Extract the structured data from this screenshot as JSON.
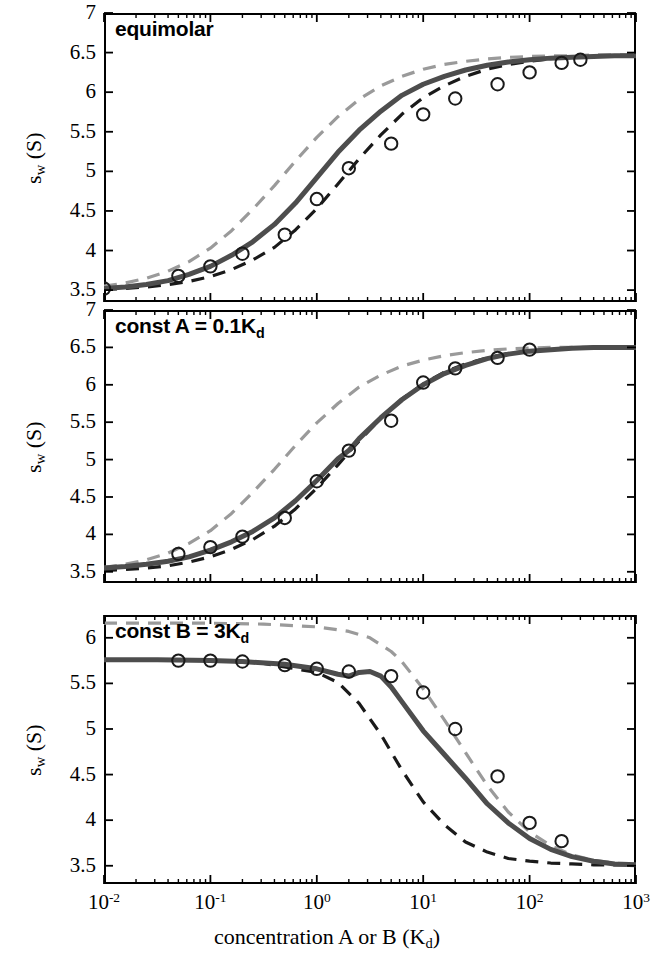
{
  "figure": {
    "xaxis": {
      "label_prefix": "concentration A or B (K",
      "label_sub": "d",
      "label_suffix": ")",
      "scale": "log",
      "min": 0.01,
      "max": 1000,
      "tick_labels": [
        "10⁻²",
        "10⁻¹",
        "10⁰",
        "10¹",
        "10²",
        "10³"
      ],
      "tick_mantissas": [
        "10",
        "10",
        "10",
        "10",
        "10",
        "10"
      ],
      "tick_exponents": [
        "-2",
        "-1",
        "0",
        "1",
        "2",
        "3"
      ],
      "tick_values": [
        0.01,
        0.1,
        1,
        10,
        100,
        1000
      ]
    },
    "yaxis": {
      "label_main": "s",
      "label_sub": "w",
      "label_unit": " (S)"
    },
    "colors": {
      "solid_curve": "#4d4d4d",
      "upper_dashed": "#9a9a9a",
      "lower_dashed": "#1a1a1a",
      "marker_edge": "#1a1a1a",
      "axis": "#000000",
      "background": "#ffffff"
    }
  },
  "chart_data": [
    {
      "type": "line",
      "panel_index": 0,
      "title_prefix": "equimolar",
      "title_sub": "",
      "title_suffix": "",
      "xlabel": "concentration A or B (Kd)",
      "ylabel": "sw (S)",
      "xscale": "log",
      "xlim": [
        0.01,
        1000
      ],
      "ylim": [
        3.35,
        7.0
      ],
      "ytick_values": [
        3.5,
        4,
        4.5,
        5,
        5.5,
        6,
        6.5,
        7
      ],
      "ytick_labels": [
        "3.5",
        "4",
        "4.5",
        "5",
        "5.5",
        "6",
        "6.5",
        "7"
      ],
      "grid": false,
      "legend": "none",
      "series": [
        {
          "name": "sw isotherm (solid, thick gray)",
          "style": "solid",
          "color": "#4d4d4d",
          "x": [
            0.01,
            0.0158,
            0.025,
            0.04,
            0.063,
            0.1,
            0.158,
            0.25,
            0.4,
            0.63,
            1.0,
            1.58,
            2.5,
            4.0,
            6.3,
            10.0,
            15.8,
            25.0,
            40.0,
            63.0,
            100.0,
            158.0,
            250.0,
            400.0,
            630.0,
            1000.0
          ],
          "y": [
            3.52,
            3.54,
            3.57,
            3.62,
            3.7,
            3.8,
            3.94,
            4.11,
            4.33,
            4.6,
            4.92,
            5.24,
            5.52,
            5.76,
            5.96,
            6.1,
            6.2,
            6.28,
            6.34,
            6.38,
            6.41,
            6.43,
            6.44,
            6.45,
            6.46,
            6.46
          ]
        },
        {
          "name": "upper bound (light gray dashed)",
          "style": "dashed",
          "color": "#9a9a9a",
          "x": [
            0.01,
            0.0158,
            0.025,
            0.04,
            0.063,
            0.1,
            0.158,
            0.25,
            0.4,
            0.63,
            1.0,
            1.58,
            2.5,
            4.0,
            6.3,
            10.0,
            15.8,
            25.0,
            40.0,
            63.0,
            100.0,
            158.0,
            250.0,
            400.0,
            630.0,
            1000.0
          ],
          "y": [
            3.55,
            3.59,
            3.65,
            3.74,
            3.86,
            4.03,
            4.25,
            4.52,
            4.82,
            5.13,
            5.43,
            5.69,
            5.91,
            6.08,
            6.2,
            6.29,
            6.35,
            6.39,
            6.42,
            6.44,
            6.45,
            6.46,
            6.46,
            6.47,
            6.47,
            6.47
          ]
        },
        {
          "name": "lower bound (black dashed)",
          "style": "dashed",
          "color": "#1a1a1a",
          "x": [
            0.01,
            0.0158,
            0.025,
            0.04,
            0.063,
            0.1,
            0.158,
            0.25,
            0.4,
            0.63,
            1.0,
            1.58,
            2.5,
            4.0,
            6.3,
            10.0,
            15.8,
            25.0,
            40.0,
            63.0,
            100.0,
            158.0,
            250.0,
            400.0,
            630.0,
            1000.0
          ],
          "y": [
            3.51,
            3.52,
            3.54,
            3.57,
            3.61,
            3.67,
            3.76,
            3.88,
            4.04,
            4.26,
            4.53,
            4.84,
            5.16,
            5.46,
            5.72,
            5.93,
            6.08,
            6.2,
            6.29,
            6.35,
            6.39,
            6.42,
            6.44,
            6.45,
            6.46,
            6.46
          ]
        }
      ],
      "markers": {
        "name": "simulated data points (open circles)",
        "x": [
          0.01,
          0.05,
          0.1,
          0.2,
          0.5,
          1.0,
          2.0,
          5.0,
          10.0,
          20.0,
          50.0,
          100.0,
          200.0,
          300.0
        ],
        "y": [
          3.52,
          3.68,
          3.8,
          3.96,
          4.2,
          4.65,
          5.04,
          5.35,
          5.72,
          5.92,
          6.1,
          6.25,
          6.37,
          6.41
        ]
      }
    },
    {
      "type": "line",
      "panel_index": 1,
      "title_prefix": "const A = 0.1K",
      "title_sub": "d",
      "title_suffix": "",
      "xlabel": "concentration A or B (Kd)",
      "ylabel": "sw (S)",
      "xscale": "log",
      "xlim": [
        0.01,
        1000
      ],
      "ylim": [
        3.35,
        7.0
      ],
      "ytick_values": [
        3.5,
        4,
        4.5,
        5,
        5.5,
        6,
        6.5,
        7
      ],
      "ytick_labels": [
        "3.5",
        "4",
        "4.5",
        "5",
        "5.5",
        "6",
        "6.5",
        "7"
      ],
      "grid": false,
      "legend": "none",
      "series": [
        {
          "name": "sw isotherm (solid, thick gray)",
          "style": "solid",
          "color": "#4d4d4d",
          "x": [
            0.01,
            0.0158,
            0.025,
            0.04,
            0.063,
            0.1,
            0.158,
            0.25,
            0.4,
            0.63,
            1.0,
            1.58,
            2.0,
            2.5,
            4.0,
            6.3,
            10.0,
            15.8,
            25.0,
            40.0,
            63.0,
            100.0,
            158.0,
            250.0,
            400.0,
            630.0,
            1000.0
          ],
          "y": [
            3.55,
            3.57,
            3.6,
            3.64,
            3.7,
            3.79,
            3.9,
            4.04,
            4.22,
            4.45,
            4.72,
            5.01,
            5.12,
            5.28,
            5.56,
            5.8,
            6.0,
            6.15,
            6.26,
            6.35,
            6.41,
            6.45,
            6.47,
            6.49,
            6.5,
            6.5,
            6.5
          ]
        },
        {
          "name": "upper bound (light gray dashed)",
          "style": "dashed",
          "color": "#9a9a9a",
          "x": [
            0.01,
            0.0158,
            0.025,
            0.04,
            0.063,
            0.1,
            0.158,
            0.25,
            0.4,
            0.63,
            1.0,
            1.58,
            2.5,
            4.0,
            6.3,
            10.0,
            15.8,
            25.0,
            40.0,
            63.0,
            100.0,
            158.0,
            250.0,
            400.0,
            630.0,
            1000.0
          ],
          "y": [
            3.56,
            3.6,
            3.66,
            3.75,
            3.88,
            4.05,
            4.28,
            4.56,
            4.87,
            5.19,
            5.49,
            5.75,
            5.97,
            6.13,
            6.25,
            6.33,
            6.39,
            6.43,
            6.46,
            6.48,
            6.49,
            6.5,
            6.5,
            6.5,
            6.51,
            6.51
          ]
        },
        {
          "name": "lower bound (black dashed)",
          "style": "dashed",
          "color": "#1a1a1a",
          "x": [
            0.01,
            0.0158,
            0.025,
            0.04,
            0.063,
            0.1,
            0.158,
            0.25,
            0.4,
            0.63,
            1.0,
            1.58,
            2.5,
            4.0,
            6.3,
            10.0,
            15.8,
            25.0,
            40.0,
            63.0,
            100.0,
            158.0,
            250.0,
            400.0,
            630.0,
            1000.0
          ],
          "y": [
            3.52,
            3.53,
            3.55,
            3.58,
            3.63,
            3.7,
            3.8,
            3.93,
            4.11,
            4.34,
            4.62,
            4.93,
            5.25,
            5.55,
            5.81,
            6.01,
            6.17,
            6.28,
            6.36,
            6.42,
            6.45,
            6.47,
            6.49,
            6.5,
            6.5,
            6.5
          ]
        }
      ],
      "markers": {
        "name": "simulated data points (open circles)",
        "x": [
          0.05,
          0.1,
          0.2,
          0.5,
          1.0,
          2.0,
          5.0,
          10.0,
          20.0,
          50.0,
          100.0
        ],
        "y": [
          3.74,
          3.83,
          3.97,
          4.22,
          4.71,
          5.12,
          5.52,
          6.03,
          6.22,
          6.36,
          6.47
        ]
      }
    },
    {
      "type": "line",
      "panel_index": 2,
      "title_prefix": "const B = 3K",
      "title_sub": "d",
      "title_suffix": "",
      "xlabel": "concentration A or B (Kd)",
      "ylabel": "sw (S)",
      "xscale": "log",
      "xlim": [
        0.01,
        1000
      ],
      "ylim": [
        3.3,
        6.25
      ],
      "ytick_values": [
        3.5,
        4,
        4.5,
        5,
        5.5,
        6
      ],
      "ytick_labels": [
        "3.5",
        "4",
        "4.5",
        "5",
        "5.5",
        "6"
      ],
      "grid": false,
      "legend": "none",
      "series": [
        {
          "name": "sw isotherm (solid, thick gray)",
          "style": "solid",
          "color": "#4d4d4d",
          "x": [
            0.01,
            0.0316,
            0.1,
            0.2,
            0.5,
            1.0,
            1.58,
            2.0,
            2.5,
            3.16,
            4.0,
            5.0,
            6.3,
            10.0,
            15.8,
            25.0,
            40.0,
            63.0,
            100.0,
            158.0,
            250.0,
            400.0,
            630.0,
            1000.0
          ],
          "y": [
            5.76,
            5.76,
            5.75,
            5.74,
            5.71,
            5.66,
            5.6,
            5.58,
            5.62,
            5.63,
            5.58,
            5.46,
            5.3,
            4.98,
            4.72,
            4.46,
            4.18,
            3.97,
            3.8,
            3.68,
            3.6,
            3.55,
            3.52,
            3.51
          ]
        },
        {
          "name": "upper bound (light gray dashed)",
          "style": "dashed",
          "color": "#9a9a9a",
          "x": [
            0.01,
            0.0316,
            0.1,
            0.316,
            1.0,
            2.0,
            3.16,
            5.0,
            6.3,
            10.0,
            15.8,
            25.0,
            40.0,
            63.0,
            100.0,
            158.0,
            250.0,
            400.0,
            630.0,
            1000.0
          ],
          "y": [
            6.16,
            6.16,
            6.16,
            6.15,
            6.12,
            6.07,
            6.0,
            5.85,
            5.74,
            5.44,
            5.1,
            4.74,
            4.38,
            4.09,
            3.87,
            3.72,
            3.62,
            3.56,
            3.53,
            3.51
          ]
        },
        {
          "name": "lower bound (black dashed)",
          "style": "dashed",
          "color": "#1a1a1a",
          "x": [
            0.01,
            0.0316,
            0.1,
            0.316,
            1.0,
            1.58,
            2.5,
            4.0,
            6.3,
            10.0,
            15.8,
            25.0,
            40.0,
            63.0,
            100.0,
            158.0,
            250.0,
            400.0,
            630.0,
            1000.0
          ],
          "y": [
            5.76,
            5.76,
            5.75,
            5.72,
            5.62,
            5.51,
            5.28,
            4.94,
            4.55,
            4.2,
            3.95,
            3.76,
            3.65,
            3.58,
            3.55,
            3.53,
            3.52,
            3.51,
            3.51,
            3.51
          ]
        }
      ],
      "markers": {
        "name": "simulated data points (open circles)",
        "x": [
          0.05,
          0.1,
          0.2,
          0.5,
          1.0,
          2.0,
          5.0,
          10.0,
          20.0,
          50.0,
          100.0,
          200.0
        ],
        "y": [
          5.75,
          5.75,
          5.74,
          5.7,
          5.66,
          5.63,
          5.58,
          5.4,
          5.0,
          4.48,
          3.97,
          3.77
        ]
      }
    }
  ]
}
